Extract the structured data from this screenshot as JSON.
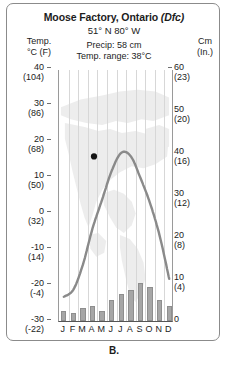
{
  "figure": {
    "caption": "B.",
    "title_city": "Moose Factory, Ontario",
    "title_koppen": "(Dfc)",
    "coordinates": "51° N 80° W",
    "precip_line": "Precip: 58 cm",
    "range_line": "Temp. range: 38°C",
    "left_axis_caption_1": "Temp.",
    "left_axis_caption_2": "°C (F)",
    "right_axis_caption_1": "Cm",
    "right_axis_caption_2": "(In.)"
  },
  "colors": {
    "bar_fill": "#a6a6a6",
    "bar_stroke": "#8e8e8e",
    "curve": "#8a8a8a",
    "dot": "#141414",
    "grid": "#d7d7d7",
    "axis": "#555555",
    "frame": "#8b8b8b",
    "text": "#1c1c1c",
    "map_watermark": "#d9d9d9"
  },
  "chart_data": {
    "type": "bar",
    "title": "Moose Factory, Ontario (Dfc)",
    "subtitle": "51° N 80° W",
    "categories": [
      "J",
      "F",
      "M",
      "A",
      "M",
      "J",
      "J",
      "A",
      "S",
      "O",
      "N",
      "D"
    ],
    "month_names": [
      "January",
      "February",
      "March",
      "April",
      "May",
      "June",
      "July",
      "August",
      "September",
      "October",
      "November",
      "December"
    ],
    "series": [
      {
        "name": "Precipitation",
        "chart_type": "bar",
        "unit": "cm",
        "axis": "right",
        "values": [
          2.5,
          2.0,
          3.0,
          3.5,
          2.5,
          5.0,
          6.5,
          7.5,
          9.0,
          8.0,
          5.0,
          3.5
        ]
      },
      {
        "name": "Temperature",
        "chart_type": "line",
        "unit": "°C",
        "axis": "left",
        "values": [
          -23,
          -21,
          -14,
          -4,
          4,
          12,
          17,
          16,
          10,
          3,
          -6,
          -18
        ]
      }
    ],
    "annotations": [
      {
        "label": "marker-dot",
        "month": "August",
        "x_category": "A",
        "temp_c": 16,
        "note": "black dot plotted just right of the temperature peak"
      }
    ],
    "left_axis": {
      "label": "Temp. °C (F)",
      "unit_primary": "°C",
      "unit_secondary": "°F",
      "ylim": [
        -30,
        40
      ],
      "ticks": [
        {
          "c": "40",
          "f": "(104)"
        },
        {
          "c": "30",
          "f": "(86)"
        },
        {
          "c": "20",
          "f": "(68)"
        },
        {
          "c": "10",
          "f": "(50)"
        },
        {
          "c": "0",
          "f": "(32)"
        },
        {
          "c": "-10",
          "f": "(14)"
        },
        {
          "c": "-20",
          "f": "(-4)"
        },
        {
          "c": "-30",
          "f": "(-22)"
        }
      ]
    },
    "right_axis": {
      "label": "Cm (In.)",
      "unit_primary": "cm",
      "unit_secondary": "in.",
      "ylim": [
        0,
        60
      ],
      "ticks": [
        {
          "cm": "60",
          "in": "(23)"
        },
        {
          "cm": "50",
          "in": "(20)"
        },
        {
          "cm": "40",
          "in": "(16)"
        },
        {
          "cm": "30",
          "in": "(12)"
        },
        {
          "cm": "20",
          "in": "(8)"
        },
        {
          "cm": "10",
          "in": "(4)"
        },
        {
          "cm": "0",
          "in": ""
        }
      ]
    },
    "grid": true,
    "legend": "none",
    "summary": {
      "annual_precip_cm": 58,
      "temp_range_c": 38,
      "koppen": "Dfc"
    }
  }
}
